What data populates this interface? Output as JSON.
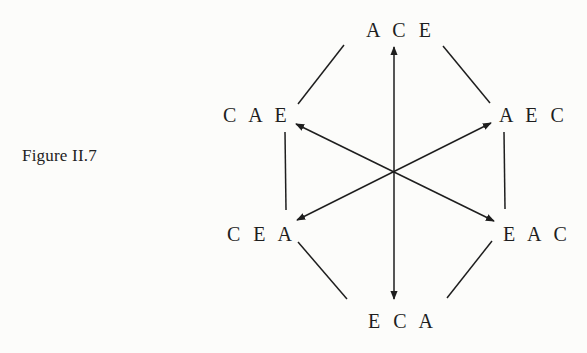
{
  "caption": "Figure II.7",
  "nodes": {
    "top": "A C E",
    "upper_left": "C A E",
    "upper_right": "A E C",
    "lower_left": "C E A",
    "lower_right": "E A C",
    "bottom": "E C A"
  },
  "colors": {
    "background": "#fcfcfa",
    "ink": "#1e1e1e"
  },
  "edges": [
    {
      "from": "ACE",
      "to": "CAE",
      "type": "line"
    },
    {
      "from": "ACE",
      "to": "AEC",
      "type": "line"
    },
    {
      "from": "CAE",
      "to": "CEA",
      "type": "line"
    },
    {
      "from": "AEC",
      "to": "EAC",
      "type": "line"
    },
    {
      "from": "CEA",
      "to": "ECA",
      "type": "line"
    },
    {
      "from": "EAC",
      "to": "ECA",
      "type": "line"
    },
    {
      "from": "ECA",
      "to": "ACE",
      "type": "double-arrow"
    },
    {
      "from": "EAC",
      "to": "CAE",
      "type": "double-arrow"
    },
    {
      "from": "CEA",
      "to": "AEC",
      "type": "double-arrow"
    }
  ]
}
